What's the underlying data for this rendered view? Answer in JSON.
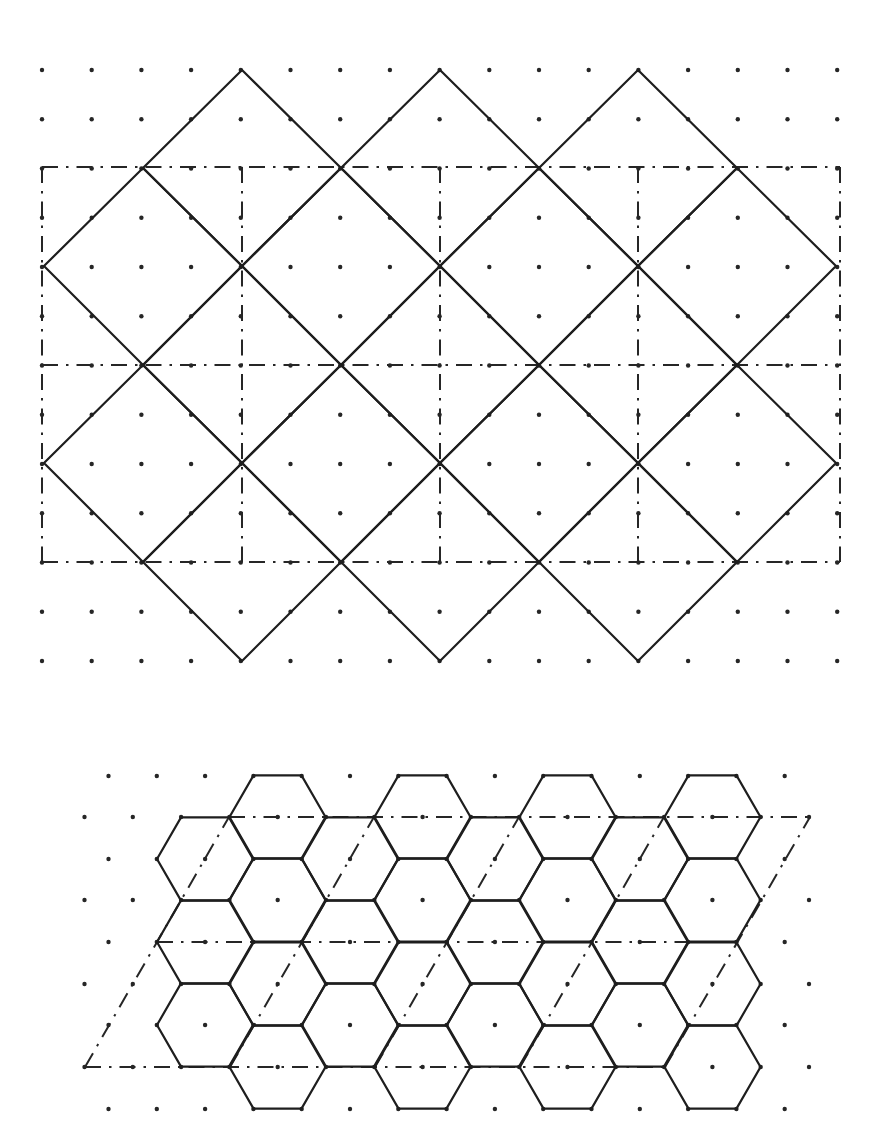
{
  "figure": {
    "width": 869,
    "height": 1140,
    "colors": {
      "ink": "#1e1e1e",
      "background": "#ffffff"
    },
    "square_tiling": {
      "description": "Square lattice dots with 45-degree rotated square tiling and dash-dot rectangular unit cells",
      "dot_lattice": {
        "x0": 42,
        "dx": 49.7,
        "cols": 17,
        "y0": 70,
        "dy": 49.25,
        "rows": 13
      },
      "tiles": [
        [
          [
            242,
            70
          ],
          [
            341,
            168
          ],
          [
            242,
            266
          ],
          [
            143,
            168
          ]
        ],
        [
          [
            440,
            70
          ],
          [
            539,
            168
          ],
          [
            440,
            266
          ],
          [
            341,
            168
          ]
        ],
        [
          [
            638,
            70
          ],
          [
            737,
            168
          ],
          [
            638,
            266
          ],
          [
            539,
            168
          ]
        ],
        [
          [
            143,
            168
          ],
          [
            242,
            266
          ],
          [
            143,
            365
          ],
          [
            44,
            266
          ]
        ],
        [
          [
            341,
            168
          ],
          [
            440,
            266
          ],
          [
            341,
            365
          ],
          [
            242,
            266
          ]
        ],
        [
          [
            539,
            168
          ],
          [
            638,
            266
          ],
          [
            539,
            365
          ],
          [
            440,
            266
          ]
        ],
        [
          [
            737,
            168
          ],
          [
            836,
            266
          ],
          [
            737,
            365
          ],
          [
            638,
            266
          ]
        ],
        [
          [
            242,
            266
          ],
          [
            341,
            365
          ],
          [
            242,
            463
          ],
          [
            143,
            365
          ]
        ],
        [
          [
            440,
            266
          ],
          [
            539,
            365
          ],
          [
            440,
            463
          ],
          [
            341,
            365
          ]
        ],
        [
          [
            638,
            266
          ],
          [
            737,
            365
          ],
          [
            638,
            463
          ],
          [
            539,
            365
          ]
        ],
        [
          [
            143,
            365
          ],
          [
            242,
            463
          ],
          [
            143,
            562
          ],
          [
            44,
            463
          ]
        ],
        [
          [
            341,
            365
          ],
          [
            440,
            463
          ],
          [
            341,
            562
          ],
          [
            242,
            463
          ]
        ],
        [
          [
            539,
            365
          ],
          [
            638,
            463
          ],
          [
            539,
            562
          ],
          [
            440,
            463
          ]
        ],
        [
          [
            737,
            365
          ],
          [
            836,
            463
          ],
          [
            737,
            562
          ],
          [
            638,
            463
          ]
        ],
        [
          [
            242,
            463
          ],
          [
            341,
            562
          ],
          [
            242,
            661
          ],
          [
            143,
            562
          ]
        ],
        [
          [
            440,
            463
          ],
          [
            539,
            562
          ],
          [
            440,
            661
          ],
          [
            341,
            562
          ]
        ],
        [
          [
            638,
            463
          ],
          [
            737,
            562
          ],
          [
            638,
            661
          ],
          [
            539,
            562
          ]
        ]
      ],
      "cell_lines": [
        [
          [
            42,
            167
          ],
          [
            840,
            167
          ]
        ],
        [
          [
            42,
            365
          ],
          [
            840,
            365
          ]
        ],
        [
          [
            42,
            562
          ],
          [
            840,
            562
          ]
        ],
        [
          [
            42,
            167
          ],
          [
            42,
            562
          ]
        ],
        [
          [
            242,
            167
          ],
          [
            242,
            562
          ]
        ],
        [
          [
            440,
            167
          ],
          [
            440,
            562
          ]
        ],
        [
          [
            638,
            167
          ],
          [
            638,
            562
          ]
        ],
        [
          [
            840,
            167
          ],
          [
            840,
            562
          ]
        ]
      ]
    },
    "hex_tiling": {
      "description": "Triangular lattice dots with hexagonal tiling and dash-dot parallelogram unit cells",
      "dot_lattice": {
        "y_rows": [
          776,
          817,
          859,
          900,
          942,
          984,
          1025,
          1067,
          1109
        ],
        "even_row_x0": 108.5,
        "odd_row_x0": 84.5,
        "dx": 48.3,
        "even_row_x_max": 790,
        "odd_row_x_max": 815
      },
      "hex_radius": 48,
      "hex_half_height": 41.6,
      "hex_centers": [
        [
          205,
          859
        ],
        [
          205,
          942
        ],
        [
          205,
          1025
        ],
        [
          277.5,
          817
        ],
        [
          277.5,
          900
        ],
        [
          277.5,
          984
        ],
        [
          277.5,
          1067
        ],
        [
          350,
          859
        ],
        [
          350,
          942
        ],
        [
          350,
          1025
        ],
        [
          422.5,
          817
        ],
        [
          422.5,
          900
        ],
        [
          422.5,
          984
        ],
        [
          422.5,
          1067
        ],
        [
          495,
          859
        ],
        [
          495,
          942
        ],
        [
          495,
          1025
        ],
        [
          567.5,
          817
        ],
        [
          567.5,
          900
        ],
        [
          567.5,
          984
        ],
        [
          567.5,
          1067
        ],
        [
          640,
          859
        ],
        [
          640,
          942
        ],
        [
          640,
          1025
        ],
        [
          712.5,
          817
        ],
        [
          712.5,
          900
        ],
        [
          712.5,
          984
        ],
        [
          712.5,
          1067
        ]
      ],
      "cell_lines": [
        [
          [
            229,
            817
          ],
          [
            810,
            817
          ]
        ],
        [
          [
            157,
            942
          ],
          [
            737,
            942
          ]
        ],
        [
          [
            85,
            1067
          ],
          [
            665,
            1067
          ]
        ],
        [
          [
            85,
            1067
          ],
          [
            229,
            817
          ]
        ],
        [
          [
            230,
            1067
          ],
          [
            374,
            817
          ]
        ],
        [
          [
            375,
            1067
          ],
          [
            519,
            817
          ]
        ],
        [
          [
            520,
            1067
          ],
          [
            664,
            817
          ]
        ],
        [
          [
            665,
            1067
          ],
          [
            810,
            817
          ]
        ]
      ]
    }
  }
}
